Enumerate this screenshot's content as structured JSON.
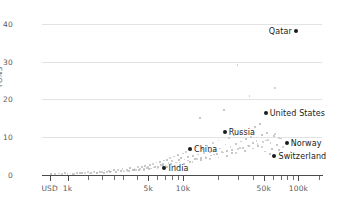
{
  "chart_data": {
    "type": "scatter",
    "title": "",
    "xlabel": "",
    "ylabel": "TONS",
    "xscale": "log",
    "xlim": [
      600,
      160000
    ],
    "ylim": [
      0,
      41
    ],
    "grid": true,
    "legend": "none",
    "y_ticks": [
      {
        "value": 40,
        "label": "40"
      },
      {
        "value": 30,
        "label": "30"
      },
      {
        "value": 20,
        "label": "20"
      },
      {
        "value": 10,
        "label": "10"
      },
      {
        "value": 0,
        "label": "0"
      }
    ],
    "x_ticks": [
      {
        "value": 700,
        "label": "USD",
        "major": true
      },
      {
        "value": 1000,
        "label": "1k",
        "major": true
      },
      {
        "value": 1500,
        "label": "",
        "major": false
      },
      {
        "value": 2000,
        "label": "",
        "major": false
      },
      {
        "value": 2500,
        "label": "",
        "major": false
      },
      {
        "value": 3000,
        "label": "",
        "major": false
      },
      {
        "value": 4000,
        "label": "",
        "major": false
      },
      {
        "value": 5000,
        "label": "5k",
        "major": true
      },
      {
        "value": 6000,
        "label": "",
        "major": false
      },
      {
        "value": 7000,
        "label": "",
        "major": false
      },
      {
        "value": 8000,
        "label": "",
        "major": false
      },
      {
        "value": 9000,
        "label": "",
        "major": false
      },
      {
        "value": 10000,
        "label": "10k",
        "major": true
      },
      {
        "value": 20000,
        "label": "",
        "major": false
      },
      {
        "value": 30000,
        "label": "",
        "major": false
      },
      {
        "value": 40000,
        "label": "",
        "major": false
      },
      {
        "value": 50000,
        "label": "50k",
        "major": true
      },
      {
        "value": 60000,
        "label": "",
        "major": false
      },
      {
        "value": 70000,
        "label": "",
        "major": false
      },
      {
        "value": 80000,
        "label": "",
        "major": false
      },
      {
        "value": 90000,
        "label": "",
        "major": false
      },
      {
        "value": 100000,
        "label": "100k",
        "major": true
      },
      {
        "value": 150000,
        "label": "",
        "major": false
      }
    ],
    "highlighted_points": [
      {
        "name": "Qatar",
        "x": 95000,
        "y": 38.0,
        "label_side": "left"
      },
      {
        "name": "United States",
        "x": 52000,
        "y": 16.3,
        "label_side": "right"
      },
      {
        "name": "Russia",
        "x": 23000,
        "y": 11.5,
        "label_side": "right"
      },
      {
        "name": "Norway",
        "x": 79000,
        "y": 8.4,
        "label_side": "right"
      },
      {
        "name": "China",
        "x": 11500,
        "y": 7.0,
        "label_side": "right"
      },
      {
        "name": "Switzerland",
        "x": 62000,
        "y": 4.9,
        "label_side": "right"
      },
      {
        "name": "India",
        "x": 6900,
        "y": 1.9,
        "label_side": "right"
      }
    ],
    "unlabeled_points": [
      [
        720,
        0.2
      ],
      [
        780,
        0.15
      ],
      [
        850,
        0.3
      ],
      [
        900,
        0.25
      ],
      [
        950,
        0.4
      ],
      [
        1000,
        0.2
      ],
      [
        1060,
        0.35
      ],
      [
        1120,
        0.3
      ],
      [
        1200,
        0.5
      ],
      [
        1280,
        0.4
      ],
      [
        1350,
        0.6
      ],
      [
        1420,
        0.45
      ],
      [
        1500,
        0.7
      ],
      [
        1600,
        0.5
      ],
      [
        1700,
        0.8
      ],
      [
        1800,
        0.6
      ],
      [
        1900,
        0.9
      ],
      [
        2000,
        0.7
      ],
      [
        2100,
        1.1
      ],
      [
        2200,
        0.8
      ],
      [
        2300,
        1.0
      ],
      [
        2400,
        0.9
      ],
      [
        2500,
        1.2
      ],
      [
        2600,
        0.7
      ],
      [
        2750,
        1.3
      ],
      [
        2900,
        1.0
      ],
      [
        3000,
        1.5
      ],
      [
        3100,
        0.9
      ],
      [
        3250,
        1.4
      ],
      [
        3400,
        1.1
      ],
      [
        3500,
        1.8
      ],
      [
        3650,
        1.2
      ],
      [
        3800,
        1.6
      ],
      [
        3950,
        1.3
      ],
      [
        4100,
        2.0
      ],
      [
        4250,
        1.5
      ],
      [
        4400,
        2.2
      ],
      [
        4550,
        1.4
      ],
      [
        4700,
        2.4
      ],
      [
        4850,
        1.8
      ],
      [
        5000,
        2.1
      ],
      [
        5150,
        2.6
      ],
      [
        5300,
        1.7
      ],
      [
        5500,
        2.9
      ],
      [
        5700,
        2.2
      ],
      [
        5900,
        3.2
      ],
      [
        6100,
        2.0
      ],
      [
        6300,
        3.5
      ],
      [
        6500,
        2.6
      ],
      [
        6700,
        3.0
      ],
      [
        6900,
        3.8
      ],
      [
        7100,
        2.4
      ],
      [
        7300,
        4.1
      ],
      [
        7500,
        3.1
      ],
      [
        7700,
        4.5
      ],
      [
        7900,
        2.8
      ],
      [
        8100,
        3.6
      ],
      [
        8400,
        4.8
      ],
      [
        8700,
        3.3
      ],
      [
        9000,
        5.2
      ],
      [
        9300,
        3.9
      ],
      [
        9600,
        4.4
      ],
      [
        10000,
        5.6
      ],
      [
        10300,
        4.0
      ],
      [
        10700,
        6.1
      ],
      [
        11000,
        4.7
      ],
      [
        11400,
        3.5
      ],
      [
        11800,
        6.5
      ],
      [
        12200,
        5.0
      ],
      [
        12600,
        4.2
      ],
      [
        13000,
        7.2
      ],
      [
        13500,
        5.4
      ],
      [
        14000,
        15.2
      ],
      [
        14200,
        4.6
      ],
      [
        14700,
        6.8
      ],
      [
        15200,
        5.8
      ],
      [
        15800,
        4.4
      ],
      [
        16400,
        7.6
      ],
      [
        17000,
        6.2
      ],
      [
        17600,
        5.1
      ],
      [
        18200,
        8.4
      ],
      [
        18900,
        6.6
      ],
      [
        19600,
        5.5
      ],
      [
        20300,
        9.1
      ],
      [
        21000,
        7.0
      ],
      [
        21800,
        6.0
      ],
      [
        22600,
        17.3
      ],
      [
        23400,
        8.0
      ],
      [
        24200,
        6.4
      ],
      [
        25000,
        9.8
      ],
      [
        25900,
        7.4
      ],
      [
        26800,
        5.9
      ],
      [
        27700,
        10.4
      ],
      [
        28700,
        8.2
      ],
      [
        29700,
        29.0
      ],
      [
        30000,
        6.8
      ],
      [
        31000,
        11.2
      ],
      [
        32000,
        8.8
      ],
      [
        33000,
        7.2
      ],
      [
        34200,
        12.0
      ],
      [
        35400,
        9.4
      ],
      [
        36600,
        7.8
      ],
      [
        37900,
        20.8
      ],
      [
        39200,
        10.0
      ],
      [
        40500,
        8.4
      ],
      [
        41900,
        12.8
      ],
      [
        43400,
        9.0
      ],
      [
        44900,
        7.6
      ],
      [
        46400,
        13.4
      ],
      [
        48000,
        10.6
      ],
      [
        49700,
        8.6
      ],
      [
        51400,
        6.2
      ],
      [
        53200,
        11.0
      ],
      [
        55000,
        9.2
      ],
      [
        57000,
        5.6
      ],
      [
        59000,
        7.0
      ],
      [
        61000,
        10.2
      ],
      [
        63000,
        23.0
      ],
      [
        65000,
        8.0
      ],
      [
        68000,
        6.6
      ],
      [
        71000,
        9.6
      ],
      [
        74000,
        7.4
      ],
      [
        80000,
        8.8
      ],
      [
        86000,
        6.0
      ],
      [
        92000,
        7.8
      ],
      [
        1150,
        0.25
      ],
      [
        1320,
        0.55
      ],
      [
        1550,
        0.35
      ],
      [
        1780,
        0.45
      ],
      [
        2050,
        0.6
      ],
      [
        2350,
        0.75
      ],
      [
        2650,
        0.85
      ],
      [
        3050,
        1.15
      ],
      [
        3350,
        0.95
      ],
      [
        3750,
        1.35
      ],
      [
        4150,
        1.25
      ],
      [
        4600,
        1.65
      ],
      [
        5050,
        1.55
      ],
      [
        5550,
        1.95
      ],
      [
        6050,
        1.75
      ],
      [
        6650,
        2.35
      ],
      [
        7250,
        2.15
      ],
      [
        7850,
        2.75
      ],
      [
        8550,
        2.45
      ],
      [
        9350,
        3.25
      ],
      [
        10200,
        2.85
      ],
      [
        11100,
        3.75
      ],
      [
        12100,
        3.35
      ],
      [
        13200,
        4.25
      ],
      [
        14400,
        3.85
      ],
      [
        15700,
        4.75
      ],
      [
        17100,
        4.15
      ],
      [
        18700,
        5.35
      ],
      [
        20400,
        4.55
      ],
      [
        22200,
        5.95
      ],
      [
        24200,
        5.15
      ],
      [
        26400,
        6.55
      ],
      [
        28800,
        5.75
      ],
      [
        31400,
        7.15
      ],
      [
        34200,
        6.35
      ],
      [
        37300,
        7.75
      ],
      [
        40700,
        6.95
      ],
      [
        44400,
        8.15
      ],
      [
        48400,
        7.35
      ],
      [
        52800,
        9.05
      ],
      [
        57600,
        8.45
      ],
      [
        62800,
        10.8
      ],
      [
        68500,
        9.8
      ]
    ],
    "point_color": "#bdbdbd",
    "highlight_color": "#1c1c1c",
    "grid_color": "#e3e3e3",
    "axis_color": "#4a4a4a",
    "text_color": "#5b5b5b",
    "background": "#ffffff"
  }
}
